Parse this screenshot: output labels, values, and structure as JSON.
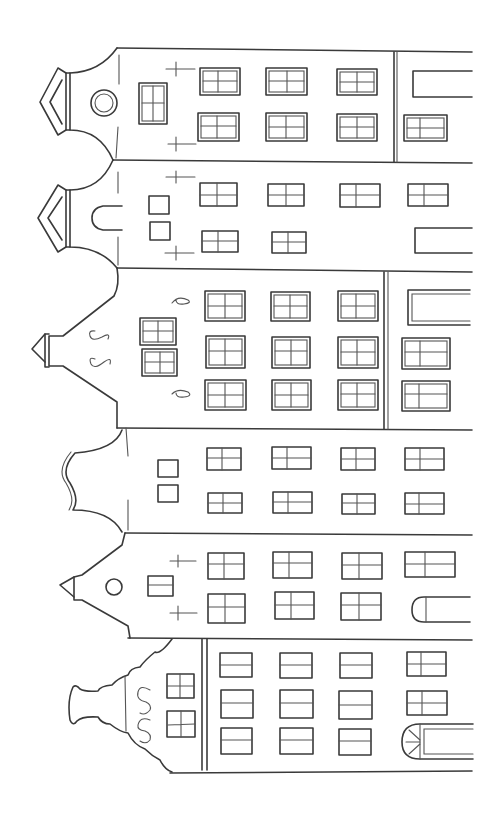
{
  "image": {
    "title": "Canal houses line drawing (rotated 90°)",
    "description": "Six gabled canal houses drawn as coloring-page line art, oriented sideways with gables on the left",
    "stroke_color": "#3a3a3a",
    "background": "#ffffff"
  },
  "houses": [
    {
      "id": "house-1",
      "gable": "neck gable with pediment cap",
      "y_top": 48,
      "y_bottom": 160,
      "features": [
        "round oculus window",
        "tall gable window",
        "two cross anchors",
        "double-frame windows",
        "ground-floor door"
      ],
      "window_columns": [
        218,
        285,
        355
      ],
      "window_rows": [
        80,
        128
      ],
      "ground_floor": [
        "door",
        "window"
      ]
    },
    {
      "id": "house-2",
      "gable": "neck gable with pediment cap",
      "y_top": 160,
      "y_bottom": 268,
      "features": [
        "arched gable window",
        "two small square windows",
        "two cross anchors"
      ],
      "window_columns": [
        218,
        285,
        355
      ],
      "window_rows": [
        192,
        240
      ],
      "ground_floor": [
        "window",
        "door"
      ]
    },
    {
      "id": "house-3",
      "gable": "spout/step gable with pointed finial",
      "y_top": 268,
      "y_bottom": 428,
      "features": [
        "S-shaped wall anchors",
        "two paired gable windows",
        "double-frame windows",
        "ground-floor door"
      ],
      "window_columns": [
        225,
        292,
        357
      ],
      "window_rows": [
        305,
        350,
        395
      ],
      "ground_floor": [
        "door",
        "window",
        "window"
      ]
    },
    {
      "id": "house-4",
      "gable": "bell gable with curved crest",
      "y_top": 428,
      "y_bottom": 532,
      "features": [
        "two small square gable windows"
      ],
      "window_columns": [
        224,
        290,
        357,
        424
      ],
      "window_rows": [
        458,
        502
      ]
    },
    {
      "id": "house-5",
      "gable": "triangular spout gable with finial",
      "y_top": 532,
      "y_bottom": 638,
      "features": [
        "round gable window",
        "small rectangular gable window",
        "two cross anchors"
      ],
      "window_columns": [
        226,
        293,
        360
      ],
      "window_rows": [
        563,
        605
      ],
      "ground_floor": [
        "window",
        "arched door"
      ]
    },
    {
      "id": "house-6",
      "gable": "scrolled bell gable",
      "y_top": 638,
      "y_bottom": 773,
      "features": [
        "S-shaped anchors",
        "two gable windows",
        "fanlight door"
      ],
      "window_columns": [
        235,
        295,
        355
      ],
      "window_rows": [
        665,
        703,
        742
      ],
      "ground_floor": [
        "window",
        "window",
        "fanlight door"
      ]
    }
  ],
  "ground_line_x": 472
}
